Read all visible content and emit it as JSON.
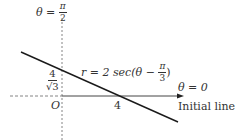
{
  "diagram": {
    "type": "polar-coordinate-line",
    "colors": {
      "line": "#1a1a1a",
      "axis": "#444444",
      "dashed": "#777777",
      "text": "#333333"
    },
    "labels": {
      "vertical_axis": {
        "lhs": "θ =",
        "num": "π",
        "den": "2"
      },
      "curve": {
        "lhs": "r = 2 sec(θ −",
        "num": "π",
        "den": "3",
        "rhs": ")"
      },
      "y_intercept": {
        "num": "4",
        "den": "√3"
      },
      "origin": "O",
      "x_intercept": "4",
      "initial_angle": "θ = 0",
      "initial_line": "Initial line"
    }
  }
}
